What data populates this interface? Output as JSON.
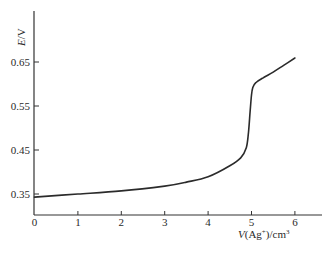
{
  "chart_data": {
    "type": "line",
    "title": "",
    "xlabel": "V(Ag+)/cm3",
    "xlabel_parts": {
      "italic": "V",
      "main": "(Ag",
      "sup1": "+",
      "mid": ")/cm",
      "sup2": "3"
    },
    "ylabel": "E/V",
    "xlim": [
      0,
      6.5
    ],
    "ylim": [
      0.343,
      0.78
    ],
    "x_ticks": [
      0,
      1,
      2,
      3,
      4,
      5,
      6
    ],
    "x_tick_labels": [
      "0",
      "1",
      "2",
      "3",
      "4",
      "5",
      "6"
    ],
    "y_ticks": [
      0.35,
      0.45,
      0.55,
      0.65
    ],
    "y_tick_labels": [
      "0.35",
      "0.45",
      "0.55",
      "0.65"
    ],
    "grid": false,
    "legend": null,
    "series": [
      {
        "name": "titration curve",
        "x": [
          0,
          1,
          2,
          3,
          3.5,
          4,
          4.5,
          4.75,
          4.88,
          4.93,
          4.97,
          5.0,
          5.03,
          5.1,
          5.25,
          5.5,
          5.75,
          6.0
        ],
        "values": [
          0.343,
          0.35,
          0.357,
          0.368,
          0.377,
          0.389,
          0.414,
          0.432,
          0.455,
          0.49,
          0.54,
          0.575,
          0.592,
          0.603,
          0.613,
          0.627,
          0.643,
          0.659
        ]
      }
    ]
  }
}
